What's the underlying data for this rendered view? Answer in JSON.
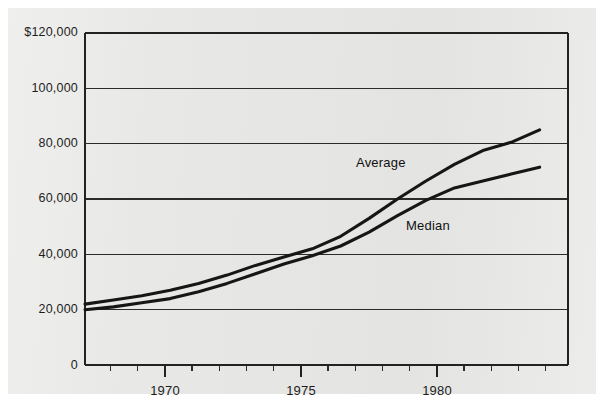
{
  "chart_data": {
    "type": "line",
    "title": "",
    "subtitle": "",
    "xlabel": "",
    "ylabel": "",
    "xlim": [
      1967,
      1984
    ],
    "ylim": [
      0,
      120000
    ],
    "grid": true,
    "grid_axis": "y",
    "legend_position": "inline-annotations",
    "x_tick_labels": [
      "1970",
      "1975",
      "1980"
    ],
    "x_tick_values": [
      1970,
      1975,
      1980
    ],
    "x_minor_tick_interval": 1,
    "y_tick_labels": [
      "$120,000",
      "100,000",
      "80,000",
      "60,000",
      "40,000",
      "20,000",
      "0"
    ],
    "y_tick_values": [
      120000,
      100000,
      80000,
      60000,
      40000,
      20000,
      0
    ],
    "x": [
      1967,
      1968,
      1969,
      1970,
      1971,
      1972,
      1973,
      1974,
      1975,
      1976,
      1977,
      1978,
      1979,
      1980,
      1981,
      1982,
      1983
    ],
    "series": [
      {
        "name": "Average",
        "color": "#161616",
        "values": [
          22000,
          23500,
          25000,
          27000,
          29500,
          32500,
          36000,
          39000,
          42000,
          46500,
          53000,
          60000,
          66500,
          72500,
          77500,
          80500,
          85000
        ]
      },
      {
        "name": "Median",
        "color": "#161616",
        "values": [
          20000,
          21000,
          22500,
          24000,
          26500,
          29500,
          33000,
          36500,
          39500,
          43000,
          48000,
          54000,
          59500,
          64000,
          66500,
          69000,
          71500
        ]
      }
    ],
    "annotations": [
      {
        "text": "Average",
        "x": 1977.0,
        "y": 94000
      },
      {
        "text": "Median",
        "x": 1979.0,
        "y": 70000
      }
    ]
  }
}
